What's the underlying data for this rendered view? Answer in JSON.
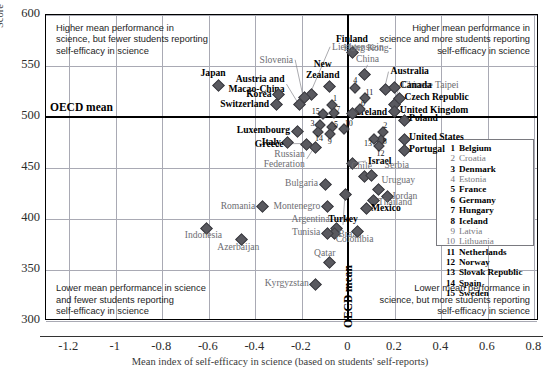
{
  "axes": {
    "ylabel": "Score",
    "xlabel": "Mean index of self-efficacy in science (based on students' self-reports)",
    "yticks": [
      "600",
      "550",
      "500",
      "450",
      "400",
      "350",
      "300"
    ],
    "xticks": [
      "-1.2",
      "-1",
      "-0.8",
      "-0.6",
      "-0.4",
      "-0.2",
      "0",
      "0.2",
      "0.4",
      "0.6",
      "0.8"
    ],
    "oecd_mean_horizontal": "OECD mean",
    "oecd_mean_vertical": "OECD mean"
  },
  "quadrant_notes": {
    "top_left": "Higher mean performance in\nscience, but fewer students reporting\nself-efficacy in science",
    "top_right": "Higher mean performance in\nscience and more students reporting\nself-efficacy in science",
    "bottom_left": "Lower mean performance in science\nand fewer students reporting\nself-efficacy in science",
    "bottom_right": "Lower mean performance in\nscience, but more students reporting\nself-efficacy in science"
  },
  "legend": {
    "items": [
      {
        "num": "1",
        "name": "Belgium",
        "group": "oecd"
      },
      {
        "num": "2",
        "name": "Croatia",
        "group": "part"
      },
      {
        "num": "3",
        "name": "Denmark",
        "group": "oecd"
      },
      {
        "num": "4",
        "name": "Estonia",
        "group": "part"
      },
      {
        "num": "5",
        "name": "France",
        "group": "oecd"
      },
      {
        "num": "6",
        "name": "Germany",
        "group": "oecd"
      },
      {
        "num": "7",
        "name": "Hungary",
        "group": "oecd"
      },
      {
        "num": "8",
        "name": "Iceland",
        "group": "oecd"
      },
      {
        "num": "9",
        "name": "Latvia",
        "group": "part"
      },
      {
        "num": "10",
        "name": "Lithuania",
        "group": "part"
      },
      {
        "num": "11",
        "name": "Netherlands",
        "group": "oecd"
      },
      {
        "num": "12",
        "name": "Norway",
        "group": "oecd"
      },
      {
        "num": "13",
        "name": "Slovak Republic",
        "group": "oecd"
      },
      {
        "num": "14",
        "name": "Spain",
        "group": "oecd"
      },
      {
        "num": "15",
        "name": "Sweden",
        "group": "oecd"
      }
    ]
  },
  "chart_data": {
    "type": "scatter",
    "title": "",
    "xlabel": "Mean index of self-efficacy in science (based on students' self-reports)",
    "ylabel": "Score",
    "xlim": [
      -1.3,
      0.82
    ],
    "ylim": [
      300,
      600
    ],
    "grid": true,
    "reference_lines": {
      "x": 0.0,
      "y": 500
    },
    "points": [
      {
        "name": "Japan",
        "x": -0.56,
        "y": 531,
        "group": "oecd",
        "lab_dx": -4,
        "lab_dy": -16,
        "align": "center"
      },
      {
        "name": "Liechtenstein",
        "x": -0.16,
        "y": 522,
        "group": "part",
        "lab_dx": 22,
        "lab_dy": -52,
        "align": "left",
        "leader": true
      },
      {
        "name": "Slovenia",
        "x": -0.19,
        "y": 519,
        "group": "part",
        "lab_dx": -10,
        "lab_dy": -42,
        "align": "right",
        "leader": true
      },
      {
        "name": "Austria and\nMacao-China",
        "x": -0.21,
        "y": 512,
        "group": "mixed",
        "lab_dx": -14,
        "lab_dy": -30,
        "align": "right",
        "leader": true
      },
      {
        "name": "New\nZealand",
        "x": -0.08,
        "y": 530,
        "group": "oecd",
        "lab_dx": -6,
        "lab_dy": -26,
        "align": "center"
      },
      {
        "name": "Korea",
        "x": -0.3,
        "y": 522,
        "group": "oecd",
        "lab_dx": -6,
        "lab_dy": -5,
        "align": "right"
      },
      {
        "name": "Switzerland",
        "x": -0.31,
        "y": 512,
        "group": "oecd",
        "lab_dx": -6,
        "lab_dy": -5,
        "align": "right"
      },
      {
        "name": "Finland",
        "x": 0.02,
        "y": 563,
        "group": "oecd",
        "lab_dx": 0,
        "lab_dy": -18,
        "align": "center"
      },
      {
        "name": "Hong Kong-\nChina",
        "x": 0.07,
        "y": 542,
        "group": "part",
        "lab_dx": 4,
        "lab_dy": -30,
        "align": "center",
        "leader": true
      },
      {
        "name": "Australia",
        "x": 0.16,
        "y": 527,
        "group": "oecd",
        "lab_dx": 6,
        "lab_dy": -22,
        "align": "left",
        "leader": true
      },
      {
        "name": "Chinese Taipei",
        "x": 0.2,
        "y": 512,
        "group": "part",
        "lab_dx": 8,
        "lab_dy": -24,
        "align": "left",
        "leader": true
      },
      {
        "name": "Canada",
        "x": 0.2,
        "y": 529,
        "group": "oecd",
        "lab_dx": 6,
        "lab_dy": -6,
        "align": "left"
      },
      {
        "name": "Czech Republic",
        "x": 0.22,
        "y": 518,
        "group": "oecd",
        "lab_dx": 6,
        "lab_dy": -6,
        "align": "left"
      },
      {
        "name": "United Kingdom",
        "x": 0.2,
        "y": 505,
        "group": "oecd",
        "lab_dx": 6,
        "lab_dy": -6,
        "align": "left"
      },
      {
        "name": "Poland",
        "x": 0.24,
        "y": 497,
        "group": "oecd",
        "lab_dx": 6,
        "lab_dy": -6,
        "align": "left"
      },
      {
        "name": "Ireland",
        "x": 0.02,
        "y": 503,
        "group": "oecd",
        "lab_dx": 5,
        "lab_dy": -6,
        "align": "left"
      },
      {
        "name": "United States",
        "x": 0.24,
        "y": 478,
        "group": "oecd",
        "lab_dx": 6,
        "lab_dy": -6,
        "align": "left"
      },
      {
        "name": "Portugal",
        "x": 0.24,
        "y": 467,
        "group": "oecd",
        "lab_dx": 6,
        "lab_dy": -6,
        "align": "left"
      },
      {
        "name": "Luxembourg",
        "x": -0.22,
        "y": 486,
        "group": "oecd",
        "lab_dx": -6,
        "lab_dy": -5,
        "align": "right"
      },
      {
        "name": "Italy",
        "x": -0.26,
        "y": 475,
        "group": "oecd",
        "lab_dx": -6,
        "lab_dy": -5,
        "align": "right"
      },
      {
        "name": "Greece",
        "x": -0.18,
        "y": 473,
        "group": "oecd",
        "lab_dx": -22,
        "lab_dy": -5,
        "align": "right",
        "leader": true
      },
      {
        "name": "Russian\nFederation",
        "x": -0.14,
        "y": 470,
        "group": "part",
        "lab_dx": -10,
        "lab_dy": 2,
        "align": "right",
        "leader": true
      },
      {
        "name": "Israel",
        "x": 0.02,
        "y": 454,
        "group": "oecd",
        "lab_dx": 16,
        "lab_dy": -7,
        "align": "left",
        "leader": true
      },
      {
        "name": "Chile",
        "x": 0.07,
        "y": 442,
        "group": "part",
        "lab_dx": -2,
        "lab_dy": -14,
        "align": "center"
      },
      {
        "name": "Serbia",
        "x": 0.1,
        "y": 443,
        "group": "part",
        "lab_dx": 14,
        "lab_dy": -14,
        "align": "left"
      },
      {
        "name": "Uruguay",
        "x": 0.13,
        "y": 429,
        "group": "part",
        "lab_dx": 4,
        "lab_dy": -13,
        "align": "left"
      },
      {
        "name": "Jordan",
        "x": 0.17,
        "y": 422,
        "group": "part",
        "lab_dx": 5,
        "lab_dy": -5,
        "align": "left"
      },
      {
        "name": "Bulgaria",
        "x": -0.1,
        "y": 434,
        "group": "part",
        "lab_dx": -6,
        "lab_dy": -5,
        "align": "right"
      },
      {
        "name": "Thailand",
        "x": 0.11,
        "y": 418,
        "group": "part",
        "lab_dx": 5,
        "lab_dy": -3,
        "align": "left"
      },
      {
        "name": "Mexico",
        "x": 0.08,
        "y": 410,
        "group": "oecd",
        "lab_dx": 5,
        "lab_dy": -5,
        "align": "left"
      },
      {
        "name": "Montenegro",
        "x": -0.09,
        "y": 412,
        "group": "part",
        "lab_dx": -6,
        "lab_dy": -5,
        "align": "right"
      },
      {
        "name": "Turkey",
        "x": -0.01,
        "y": 424,
        "group": "oecd",
        "lab_dx": -2,
        "lab_dy": 20,
        "align": "center",
        "leader": true
      },
      {
        "name": "Argentina",
        "x": -0.05,
        "y": 391,
        "group": "part",
        "lab_dx": -6,
        "lab_dy": -13,
        "align": "right"
      },
      {
        "name": "Brazil",
        "x": -0.06,
        "y": 386,
        "group": "part",
        "lab_dx": 5,
        "lab_dy": -3,
        "align": "left"
      },
      {
        "name": "Tunisia",
        "x": -0.09,
        "y": 386,
        "group": "part",
        "lab_dx": -6,
        "lab_dy": -5,
        "align": "right"
      },
      {
        "name": "Colombia",
        "x": 0.04,
        "y": 388,
        "group": "part",
        "lab_dx": -2,
        "lab_dy": 4,
        "align": "center"
      },
      {
        "name": "Qatar",
        "x": -0.08,
        "y": 357,
        "group": "part",
        "lab_dx": -4,
        "lab_dy": -14,
        "align": "center"
      },
      {
        "name": "Kyrgyzstan",
        "x": -0.14,
        "y": 336,
        "group": "part",
        "lab_dx": -6,
        "lab_dy": -5,
        "align": "right"
      },
      {
        "name": "Romania",
        "x": -0.37,
        "y": 412,
        "group": "part",
        "lab_dx": -6,
        "lab_dy": -5,
        "align": "right"
      },
      {
        "name": "Indonesia",
        "x": -0.61,
        "y": 391,
        "group": "part",
        "lab_dx": -2,
        "lab_dy": 3,
        "align": "center"
      },
      {
        "name": "Azerbaijan",
        "x": -0.46,
        "y": 380,
        "group": "part",
        "lab_dx": -2,
        "lab_dy": 4,
        "align": "center"
      }
    ],
    "numbered_points": [
      {
        "num": "4",
        "x": 0.03,
        "y": 528,
        "lab_dx": -1,
        "lab_dy": -11
      },
      {
        "num": "11",
        "x": 0.07,
        "y": 519,
        "lab_dx": 2,
        "lab_dy": -9
      },
      {
        "num": "6",
        "x": 0.05,
        "y": 508,
        "lab_dx": 2,
        "lab_dy": -9
      },
      {
        "num": "1",
        "x": -0.07,
        "y": 512,
        "lab_dx": 2,
        "lab_dy": -10
      },
      {
        "num": "7",
        "x": -0.06,
        "y": 504,
        "lab_dx": 3,
        "lab_dy": -7
      },
      {
        "num": "15",
        "x": -0.11,
        "y": 503,
        "lab_dx": -10,
        "lab_dy": -6
      },
      {
        "num": "3",
        "x": -0.12,
        "y": 492,
        "lab_dx": -9,
        "lab_dy": -5
      },
      {
        "num": "5",
        "x": -0.07,
        "y": 490,
        "lab_dx": 3,
        "lab_dy": -6
      },
      {
        "num": "14",
        "x": -0.13,
        "y": 485,
        "lab_dx": -2,
        "lab_dy": 3
      },
      {
        "num": "9",
        "x": -0.08,
        "y": 483,
        "lab_dx": -1,
        "lab_dy": 4
      },
      {
        "num": "10",
        "x": -0.02,
        "y": 488,
        "lab_dx": 2,
        "lab_dy": -9
      },
      {
        "num": "2",
        "x": 0.15,
        "y": 485,
        "lab_dx": 1,
        "lab_dy": -10
      },
      {
        "num": "8",
        "x": 0.14,
        "y": 477,
        "lab_dx": 3,
        "lab_dy": -2
      },
      {
        "num": "13",
        "x": 0.11,
        "y": 478,
        "lab_dx": -9,
        "lab_dy": 1
      },
      {
        "num": "12",
        "x": 0.13,
        "y": 472,
        "lab_dx": -1,
        "lab_dy": 4
      }
    ]
  }
}
